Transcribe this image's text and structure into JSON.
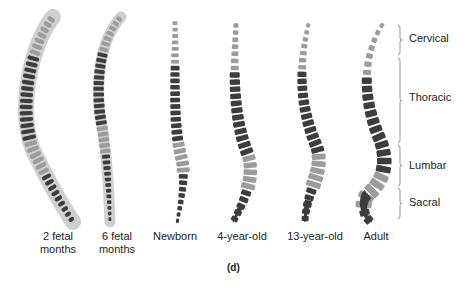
{
  "figure": {
    "panel_label": "(d)",
    "stages": [
      {
        "label": "2 fetal\nmonths"
      },
      {
        "label": "6 fetal\nmonths"
      },
      {
        "label": "Newborn"
      },
      {
        "label": "4-year-old"
      },
      {
        "label": "13-year-old"
      },
      {
        "label": "Adult"
      }
    ],
    "regions": [
      {
        "label": "Cervical"
      },
      {
        "label": "Thoracic"
      },
      {
        "label": "Lumbar"
      },
      {
        "label": "Sacral"
      }
    ],
    "colors": {
      "cervical_lumbar": "#9c9c9c",
      "thoracic_sacral": "#3d3d3d",
      "outline": "#cfcfcf",
      "bracket": "#8a8a8a"
    }
  }
}
